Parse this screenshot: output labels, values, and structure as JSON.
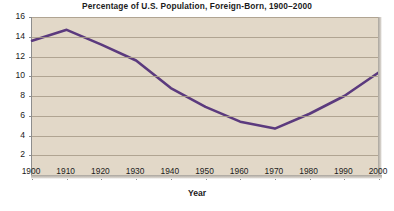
{
  "chart_data": {
    "type": "line",
    "title": "Percentage of U.S. Population, Foreign-Born, 1900–2000",
    "xlabel": "Year",
    "ylabel": "",
    "x": [
      1900,
      1910,
      1920,
      1930,
      1940,
      1950,
      1960,
      1970,
      1980,
      1990,
      2000
    ],
    "values": [
      13.6,
      14.7,
      13.2,
      11.6,
      8.8,
      6.9,
      5.4,
      4.7,
      6.2,
      8.0,
      10.4
    ],
    "series": [
      {
        "name": "Foreign-Born Percentage",
        "values": [
          13.6,
          14.7,
          13.2,
          11.6,
          8.8,
          6.9,
          5.4,
          4.7,
          6.2,
          8.0,
          10.4
        ]
      }
    ],
    "xtick_labels": [
      "1900",
      "1910",
      "1920",
      "1930",
      "1940",
      "1950",
      "1960",
      "1970",
      "1980",
      "1990",
      "2000"
    ],
    "ytick_labels": [
      "2",
      "4",
      "6",
      "8",
      "10",
      "12",
      "14",
      "16"
    ],
    "ytick_values": [
      2,
      4,
      6,
      8,
      10,
      12,
      14,
      16
    ],
    "xlim": [
      1900,
      2000
    ],
    "ylim": [
      0,
      16
    ],
    "grid": true,
    "legend": "none",
    "line_color": "#5b3a7e",
    "plot_background": "#e2d8c8",
    "gridline_color": "#a79b88",
    "axis_color": "#8d8d8d",
    "figure_background": "#ffffff",
    "text_color": "#1b1b1b"
  }
}
